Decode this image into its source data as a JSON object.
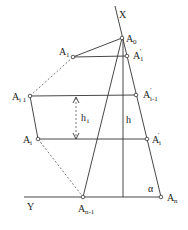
{
  "diagram": {
    "type": "geometric-construction",
    "axes": {
      "x_label": "X",
      "y_label": "Y"
    },
    "points": [
      {
        "id": "A0",
        "label": "A",
        "sub": "0",
        "x": 122,
        "y": 38
      },
      {
        "id": "A1",
        "label": "A",
        "sub": "1",
        "x": 73,
        "y": 57
      },
      {
        "id": "A1p",
        "label": "A",
        "sub": "1",
        "prime": true,
        "x": 127,
        "y": 56
      },
      {
        "id": "Ai1",
        "label": "A",
        "sub": "i 1",
        "x": 30,
        "y": 96
      },
      {
        "id": "Ai1p",
        "label": "A",
        "sub": "i-1",
        "prime": true,
        "x": 136,
        "y": 95
      },
      {
        "id": "Ai",
        "label": "A",
        "sub": "i",
        "x": 38,
        "y": 139
      },
      {
        "id": "Aip",
        "label": "A",
        "sub": "i",
        "prime": true,
        "x": 147,
        "y": 139
      },
      {
        "id": "An1",
        "label": "A",
        "sub": "n-1",
        "x": 83,
        "y": 197
      },
      {
        "id": "An",
        "label": "A",
        "sub": "n",
        "x": 161,
        "y": 197
      }
    ],
    "annotations": {
      "h_i": "h",
      "h_i_sub": "i",
      "h": "h",
      "alpha": "α"
    }
  }
}
